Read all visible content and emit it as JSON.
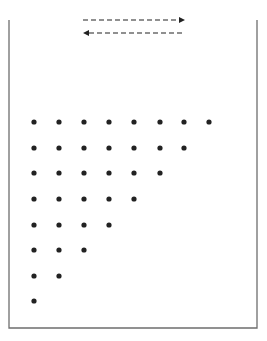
{
  "diagram": {
    "title": "",
    "colors": {
      "background": "#ffffff",
      "border": "#6e6e6e",
      "ink": "#222222"
    },
    "container": {
      "x": 9,
      "y": 20,
      "width": 248,
      "height": 308
    },
    "arrows": [
      {
        "name": "arrow-right",
        "direction": "right",
        "x1": 83,
        "x2": 185,
        "y": 20
      },
      {
        "name": "arrow-left",
        "direction": "left",
        "x1": 83,
        "x2": 185,
        "y": 33
      }
    ],
    "dots": {
      "radius": 2.6,
      "columns_x": [
        34,
        59,
        84,
        109,
        134,
        160,
        184,
        209
      ],
      "rows": [
        {
          "y": 122,
          "count": 8
        },
        {
          "y": 148,
          "count": 7
        },
        {
          "y": 173,
          "count": 6
        },
        {
          "y": 199,
          "count": 5
        },
        {
          "y": 225,
          "count": 4
        },
        {
          "y": 250,
          "count": 3
        },
        {
          "y": 276,
          "count": 2
        },
        {
          "y": 301,
          "count": 1
        }
      ]
    }
  }
}
